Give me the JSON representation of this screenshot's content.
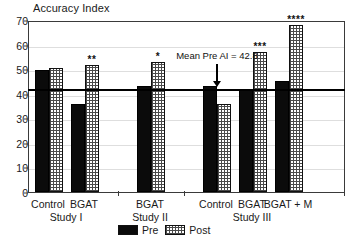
{
  "chart_data": {
    "type": "bar",
    "title": "Accuracy Index",
    "xlabel": "",
    "ylabel": "Accuracy Index",
    "ylim": [
      0,
      70
    ],
    "ytick_step": 10,
    "yticks": [
      0,
      10,
      20,
      30,
      40,
      50,
      60,
      70
    ],
    "grid": true,
    "legend_position": "bottom-center",
    "categories": [
      "Control (Study I)",
      "BGAT (Study I)",
      "BGAT (Study II)",
      "Control (Study III)",
      "BGAT (Study III)",
      "BGAT + M (Study III)"
    ],
    "series": [
      {
        "name": "Pre",
        "values": [
          49.5,
          36.0,
          43.0,
          43.0,
          42.0,
          45.0
        ]
      },
      {
        "name": "Post",
        "values": [
          50.5,
          51.5,
          53.0,
          36.0,
          57.0,
          68.0
        ]
      }
    ],
    "annotations": {
      "reference_line": {
        "label": "Mean Pre AI = 42.8",
        "value": 42.8,
        "arrow": true
      },
      "significance": [
        "",
        "**",
        "*",
        "",
        "***",
        "****"
      ]
    },
    "groups": [
      {
        "study": "Study I",
        "conditions": [
          "Control",
          "BGAT"
        ]
      },
      {
        "study": "Study II",
        "conditions": [
          "BGAT"
        ]
      },
      {
        "study": "Study III",
        "conditions": [
          "Control",
          "BGAT",
          "BGAT + M"
        ]
      }
    ]
  },
  "colors": {
    "pre_fill": "#0b0b0b",
    "post_fill": "#ffffff",
    "post_hatch": "#4a4a4a",
    "axis": "#3a3a3a",
    "grid": "#dedede",
    "text": "#1a1a1a",
    "mean_line": "#000000"
  },
  "legend": {
    "items": [
      {
        "label": "Pre",
        "style": "solid-black"
      },
      {
        "label": "Post",
        "style": "cross-hatch"
      }
    ]
  },
  "axis": {
    "y_tick_labels": [
      "70",
      "60",
      "50",
      "40",
      "30",
      "20",
      "10",
      "0"
    ]
  }
}
